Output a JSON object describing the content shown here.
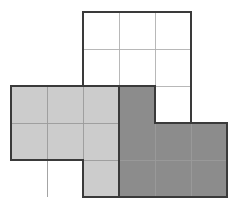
{
  "figure": {
    "name": "polyomino-grid-figure",
    "canvas": {
      "width": 236,
      "height": 209,
      "background": "#ffffff"
    },
    "grid": {
      "origin_x": 11,
      "origin_y": 12,
      "cell_width": 36,
      "cell_height": 37,
      "columns": 6,
      "rows": 5,
      "column_edges": [
        11,
        47,
        83,
        119,
        155,
        191,
        227
      ],
      "row_edges": [
        12,
        49,
        86,
        123,
        160,
        197
      ]
    },
    "colors": {
      "white_fill": "#ffffff",
      "light_gray_fill": "#cccccc",
      "dark_gray_fill": "#8c8c8c",
      "inner_gridline": "#9a9a9a",
      "light_inner_gridline": "#b0b0b0",
      "outline": "#3a3a3a",
      "background": "#ffffff"
    },
    "stroke_widths": {
      "outline": 2.2,
      "inner": 0.9
    },
    "cells": [
      {
        "id": "c-r0-c2",
        "row": 0,
        "col": 2,
        "fill": "white"
      },
      {
        "id": "c-r0-c3",
        "row": 0,
        "col": 3,
        "fill": "white"
      },
      {
        "id": "c-r0-c4",
        "row": 0,
        "col": 4,
        "fill": "white"
      },
      {
        "id": "c-r1-c2",
        "row": 1,
        "col": 2,
        "fill": "white"
      },
      {
        "id": "c-r1-c3",
        "row": 1,
        "col": 3,
        "fill": "white"
      },
      {
        "id": "c-r1-c4",
        "row": 1,
        "col": 4,
        "fill": "white"
      },
      {
        "id": "c-r2-c0",
        "row": 2,
        "col": 0,
        "fill": "light"
      },
      {
        "id": "c-r2-c1",
        "row": 2,
        "col": 1,
        "fill": "light"
      },
      {
        "id": "c-r2-c2",
        "row": 2,
        "col": 2,
        "fill": "light"
      },
      {
        "id": "c-r2-c3",
        "row": 2,
        "col": 3,
        "fill": "dark"
      },
      {
        "id": "c-r2-c4",
        "row": 2,
        "col": 4,
        "fill": "white"
      },
      {
        "id": "c-r3-c0",
        "row": 3,
        "col": 0,
        "fill": "light"
      },
      {
        "id": "c-r3-c1",
        "row": 3,
        "col": 1,
        "fill": "light"
      },
      {
        "id": "c-r3-c2",
        "row": 3,
        "col": 2,
        "fill": "light"
      },
      {
        "id": "c-r3-c3",
        "row": 3,
        "col": 3,
        "fill": "dark"
      },
      {
        "id": "c-r3-c4",
        "row": 3,
        "col": 4,
        "fill": "dark"
      },
      {
        "id": "c-r3-c5",
        "row": 3,
        "col": 5,
        "fill": "dark"
      },
      {
        "id": "c-r4-c2",
        "row": 4,
        "col": 2,
        "fill": "light"
      },
      {
        "id": "c-r4-c3",
        "row": 4,
        "col": 3,
        "fill": "dark"
      },
      {
        "id": "c-r4-c4",
        "row": 4,
        "col": 4,
        "fill": "dark"
      },
      {
        "id": "c-r4-c5",
        "row": 4,
        "col": 5,
        "fill": "dark"
      }
    ],
    "regions": [
      {
        "id": "white-region",
        "name": "white-polyomino",
        "fill": "white",
        "cell_count": 7,
        "outline_points": "83,12 191,12 191,123 155,123 155,86 83,86"
      },
      {
        "id": "light-region",
        "name": "light-gray-polyomino",
        "fill": "light",
        "cell_count": 7,
        "outline_points": "11,86 119,86 119,197 83,197 83,160 11,160"
      },
      {
        "id": "dark-region",
        "name": "dark-gray-polyomino",
        "fill": "dark",
        "cell_count": 7,
        "outline_points": "119,86 155,86 155,123 227,123 227,197 119,197"
      }
    ],
    "inner_lines": [
      {
        "id": "il-1",
        "x1": 119,
        "y1": 12,
        "x2": 119,
        "y2": 86,
        "weight": "light"
      },
      {
        "id": "il-2",
        "x1": 155,
        "y1": 12,
        "x2": 155,
        "y2": 86,
        "weight": "light"
      },
      {
        "id": "il-3",
        "x1": 83,
        "y1": 49,
        "x2": 191,
        "y2": 49,
        "weight": "light"
      },
      {
        "id": "il-4",
        "x1": 155,
        "y1": 86,
        "x2": 191,
        "y2": 86,
        "weight": "light"
      },
      {
        "id": "il-5",
        "x1": 47,
        "y1": 86,
        "x2": 47,
        "y2": 197,
        "weight": "inner"
      },
      {
        "id": "il-6",
        "x1": 83,
        "y1": 86,
        "x2": 83,
        "y2": 197,
        "weight": "inner"
      },
      {
        "id": "il-7",
        "x1": 11,
        "y1": 123,
        "x2": 119,
        "y2": 123,
        "weight": "inner"
      },
      {
        "id": "il-8",
        "x1": 83,
        "y1": 160,
        "x2": 227,
        "y2": 160,
        "weight": "inner"
      },
      {
        "id": "il-9",
        "x1": 155,
        "y1": 123,
        "x2": 155,
        "y2": 197,
        "weight": "inner"
      },
      {
        "id": "il-10",
        "x1": 191,
        "y1": 123,
        "x2": 191,
        "y2": 197,
        "weight": "inner"
      },
      {
        "id": "il-11",
        "x1": 119,
        "y1": 86,
        "x2": 119,
        "y2": 197,
        "weight": "inner"
      }
    ]
  }
}
